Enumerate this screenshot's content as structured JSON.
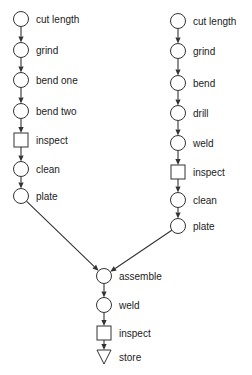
{
  "diagram": {
    "type": "flow-process-chart",
    "colors": {
      "stroke": "#333333",
      "text": "#222222",
      "background": "#ffffff"
    },
    "legend_symbols": {
      "circle": "operation",
      "square": "inspection",
      "triangle": "storage"
    },
    "branches": [
      {
        "name": "left-branch",
        "x": 21,
        "steps": [
          {
            "label": "cut length",
            "shape": "circle",
            "y": 19
          },
          {
            "label": "grind",
            "shape": "circle",
            "y": 50
          },
          {
            "label": "bend one",
            "shape": "circle",
            "y": 80
          },
          {
            "label": "bend two",
            "shape": "circle",
            "y": 111
          },
          {
            "label": "inspect",
            "shape": "square",
            "y": 140
          },
          {
            "label": "clean",
            "shape": "circle",
            "y": 169
          },
          {
            "label": "plate",
            "shape": "circle",
            "y": 196
          }
        ]
      },
      {
        "name": "right-branch",
        "x": 178,
        "steps": [
          {
            "label": "cut length",
            "shape": "circle",
            "y": 21
          },
          {
            "label": "grind",
            "shape": "circle",
            "y": 51
          },
          {
            "label": "bend",
            "shape": "circle",
            "y": 83
          },
          {
            "label": "drill",
            "shape": "circle",
            "y": 113
          },
          {
            "label": "weld",
            "shape": "circle",
            "y": 143
          },
          {
            "label": "inspect",
            "shape": "square",
            "y": 172
          },
          {
            "label": "clean",
            "shape": "circle",
            "y": 200
          },
          {
            "label": "plate",
            "shape": "circle",
            "y": 226
          }
        ]
      },
      {
        "name": "final-assembly",
        "x": 104,
        "steps": [
          {
            "label": "assemble",
            "shape": "circle",
            "y": 276
          },
          {
            "label": "weld",
            "shape": "circle",
            "y": 305
          },
          {
            "label": "inspect",
            "shape": "square",
            "y": 333
          },
          {
            "label": "store",
            "shape": "triangle",
            "y": 357
          }
        ]
      }
    ],
    "merge": {
      "from": [
        "left-branch",
        "right-branch"
      ],
      "to": "final-assembly"
    }
  }
}
